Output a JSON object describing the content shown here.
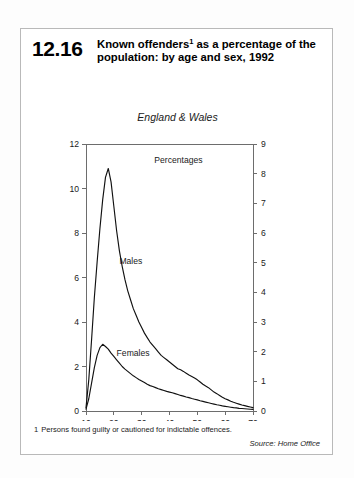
{
  "figure": {
    "number": "12.16",
    "title_line1": "Known offenders",
    "title_marker": "1",
    "title_rest": " as a percentage",
    "title_line2": "of the population: by age and sex,",
    "title_line3": "1992",
    "footnote_number": "1",
    "footnote_text": "Persons found guilty or cautioned for indictable offences.",
    "source": "Source: Home Office"
  },
  "chart_data": {
    "type": "line",
    "subtitle": "England & Wales",
    "units_label": "Percentages",
    "xlabel": "Age",
    "ylabel": "",
    "xlim": [
      10,
      70
    ],
    "ylim_left": [
      0,
      12
    ],
    "ylim_right": [
      0,
      9
    ],
    "xticks": [
      10,
      20,
      30,
      40,
      50,
      60,
      70
    ],
    "yticks_left": [
      0,
      2,
      4,
      6,
      8,
      10,
      12
    ],
    "yticks_right": [
      0,
      1,
      2,
      3,
      4,
      5,
      6,
      7,
      8,
      9
    ],
    "grid": false,
    "legend": "inline-labels",
    "left_axis_series": "Males",
    "right_axis_series": "Females",
    "series": [
      {
        "name": "Males",
        "axis": "left",
        "x": [
          10,
          11,
          12,
          13,
          14,
          15,
          16,
          17,
          18,
          19,
          20,
          21,
          22,
          23,
          24,
          25,
          26,
          27,
          28,
          29,
          30,
          31,
          32,
          33,
          34,
          35,
          36,
          37,
          38,
          39,
          40,
          41,
          42,
          43,
          44,
          45,
          46,
          47,
          48,
          49,
          50,
          51,
          52,
          53,
          54,
          55,
          56,
          57,
          58,
          59,
          60,
          61,
          62,
          63,
          64,
          65,
          66,
          67,
          68,
          69,
          70
        ],
        "values": [
          0.15,
          1.4,
          3.2,
          5.1,
          6.7,
          8.2,
          9.5,
          10.5,
          10.9,
          10.3,
          9.2,
          8.1,
          7.2,
          6.5,
          5.9,
          5.4,
          5.0,
          4.6,
          4.3,
          4.0,
          3.75,
          3.5,
          3.3,
          3.1,
          2.95,
          2.8,
          2.65,
          2.5,
          2.4,
          2.3,
          2.2,
          2.1,
          2.0,
          1.9,
          1.85,
          1.78,
          1.7,
          1.62,
          1.55,
          1.48,
          1.4,
          1.3,
          1.2,
          1.12,
          1.05,
          0.95,
          0.85,
          0.78,
          0.7,
          0.62,
          0.55,
          0.5,
          0.44,
          0.39,
          0.35,
          0.31,
          0.27,
          0.24,
          0.21,
          0.18,
          0.15
        ]
      },
      {
        "name": "Females",
        "axis": "left",
        "x": [
          10,
          11,
          12,
          13,
          14,
          15,
          16,
          17,
          18,
          19,
          20,
          21,
          22,
          23,
          24,
          25,
          26,
          27,
          28,
          29,
          30,
          31,
          32,
          33,
          34,
          35,
          36,
          37,
          38,
          39,
          40,
          41,
          42,
          43,
          44,
          45,
          46,
          47,
          48,
          49,
          50,
          51,
          52,
          53,
          54,
          55,
          56,
          57,
          58,
          59,
          60,
          61,
          62,
          63,
          64,
          65,
          66,
          67,
          68,
          69,
          70
        ],
        "values": [
          0.08,
          0.55,
          1.25,
          1.95,
          2.5,
          2.85,
          3.0,
          2.9,
          2.78,
          2.6,
          2.45,
          2.3,
          2.15,
          2.0,
          1.88,
          1.78,
          1.68,
          1.58,
          1.5,
          1.42,
          1.35,
          1.28,
          1.2,
          1.14,
          1.1,
          1.05,
          1.0,
          0.96,
          0.92,
          0.88,
          0.85,
          0.82,
          0.78,
          0.74,
          0.7,
          0.67,
          0.63,
          0.6,
          0.56,
          0.53,
          0.5,
          0.46,
          0.43,
          0.4,
          0.37,
          0.34,
          0.31,
          0.28,
          0.26,
          0.23,
          0.21,
          0.19,
          0.17,
          0.15,
          0.14,
          0.12,
          0.11,
          0.1,
          0.09,
          0.08,
          0.07
        ]
      }
    ],
    "annotations": [
      {
        "text": "Males",
        "x": 22,
        "y": 6.6
      },
      {
        "text": "Females",
        "x": 21,
        "y": 2.45
      }
    ]
  }
}
